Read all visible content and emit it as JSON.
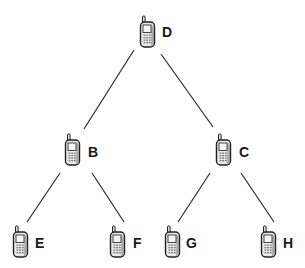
{
  "diagram": {
    "type": "tree",
    "title": "",
    "node_icon": "mobile-phone-icon",
    "colors": {
      "edge": "#2a2a2a",
      "label": "#1a1a1a",
      "phone_body": "#e8e8e8",
      "phone_outline": "#222222",
      "background": "#ffffff"
    },
    "nodes": [
      {
        "id": "D",
        "label": "D",
        "level": 0,
        "parent": null
      },
      {
        "id": "B",
        "label": "B",
        "level": 1,
        "parent": "D"
      },
      {
        "id": "C",
        "label": "C",
        "level": 1,
        "parent": "D"
      },
      {
        "id": "E",
        "label": "E",
        "level": 2,
        "parent": "B"
      },
      {
        "id": "F",
        "label": "F",
        "level": 2,
        "parent": "B"
      },
      {
        "id": "G",
        "label": "G",
        "level": 2,
        "parent": "C"
      },
      {
        "id": "H",
        "label": "H",
        "level": 2,
        "parent": "C"
      }
    ],
    "edges": [
      {
        "from": "D",
        "to": "B"
      },
      {
        "from": "D",
        "to": "C"
      },
      {
        "from": "B",
        "to": "E"
      },
      {
        "from": "B",
        "to": "F"
      },
      {
        "from": "C",
        "to": "G"
      },
      {
        "from": "C",
        "to": "H"
      }
    ]
  }
}
